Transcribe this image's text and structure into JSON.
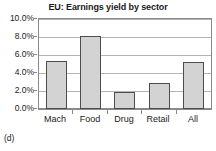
{
  "figure": {
    "caption": "(d)"
  },
  "chart_data": {
    "type": "bar",
    "title": "EU: Earnings yield by sector",
    "xlabel": "",
    "ylabel": "",
    "categories": [
      "Mach",
      "Food",
      "Drug",
      "Retail",
      "All"
    ],
    "values": [
      5.3,
      8.1,
      1.9,
      2.9,
      5.2
    ],
    "value_unit": "%",
    "ylim": [
      0.0,
      10.0
    ],
    "ytick_values": [
      0.0,
      2.0,
      4.0,
      6.0,
      8.0,
      10.0
    ],
    "ytick_labels": [
      "0.0%",
      "2.0%",
      "4.0%",
      "6.0%",
      "8.0%",
      "10.0%"
    ],
    "grid": true,
    "legend": false,
    "bar_fill_color": "#d3d3d3",
    "bar_border_color": "#4d4d4d",
    "gridline_color": "#b5b5b5",
    "axis_color": "#8a8a8a"
  }
}
